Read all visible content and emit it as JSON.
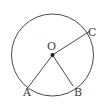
{
  "figure": {
    "kind": "circle-with-three-radii",
    "background_color": "#ffffff",
    "stroke_color": "#4a4a4a",
    "label_color": "#3a3a3a",
    "stroke_width": 1,
    "canvas": {
      "width": 106,
      "height": 108
    },
    "circle": {
      "center_x": 52.5,
      "center_y": 55,
      "radius": 41
    },
    "center_point": {
      "label": "O",
      "x": 52.5,
      "y": 55,
      "dot_radius": 2
    },
    "points": [
      {
        "label": "A",
        "x": 28,
        "y": 87.5,
        "label_x": 23,
        "label_y": 87
      },
      {
        "label": "B",
        "x": 73,
        "y": 86,
        "label_x": 74,
        "label_y": 87
      },
      {
        "label": "C",
        "x": 90,
        "y": 31,
        "label_x": 88,
        "label_y": 27
      }
    ],
    "segments": [
      {
        "name": "radius-OA",
        "x1": 52.5,
        "y1": 55,
        "x2": 28,
        "y2": 87.5
      },
      {
        "name": "radius-OB",
        "x1": 52.5,
        "y1": 55,
        "x2": 73,
        "y2": 86
      },
      {
        "name": "radius-OC",
        "x1": 52.5,
        "y1": 55,
        "x2": 90,
        "y2": 31
      }
    ],
    "labels": {
      "A": "A",
      "B": "B",
      "C": "C",
      "O": "O"
    }
  }
}
